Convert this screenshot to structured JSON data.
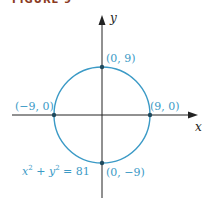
{
  "figure": {
    "title": "FIGURE 9",
    "title_color": "#8a3a22"
  },
  "axes": {
    "x_label": "x",
    "y_label": "y",
    "axis_color": "#222222"
  },
  "circle": {
    "equation_lhs_x": "x",
    "equation_lhs_y": "y",
    "exponent": "2",
    "plus": " + ",
    "equals": " = 81",
    "center": [
      0,
      0
    ],
    "radius": 9,
    "color": "#3b9ac6"
  },
  "points": [
    {
      "label": "(0, 9)",
      "x": 0,
      "y": 9
    },
    {
      "label": "(−9, 0)",
      "x": -9,
      "y": 0
    },
    {
      "label": "(9, 0)",
      "x": 9,
      "y": 0
    },
    {
      "label": "(0, −9)",
      "x": 0,
      "y": -9
    }
  ]
}
